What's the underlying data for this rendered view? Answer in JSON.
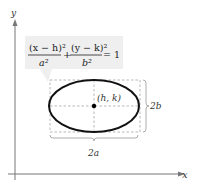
{
  "axes": {
    "x_label": "x",
    "y_label": "y"
  },
  "equation": {
    "term1_num": "(x − h)²",
    "term1_den": "a²",
    "plus": "+",
    "term2_num": "(y − k)²",
    "term2_den": "b²",
    "equals": "= 1",
    "bg_color": "#efefef"
  },
  "center_label": "(h, k)",
  "major_axis_label": "2a",
  "minor_axis_label": "2b",
  "colors": {
    "ellipse": "#111111",
    "dashed": "#999999",
    "axis": "#777777"
  }
}
